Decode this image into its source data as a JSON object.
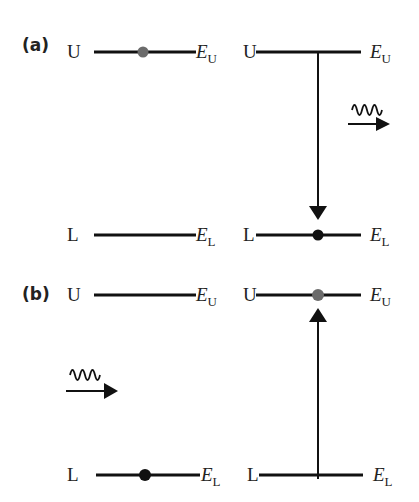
{
  "diagram": {
    "panels": [
      {
        "label": "(a)",
        "process": "emission",
        "left": {
          "upper": {
            "letter": "U",
            "energy_symbol": "E",
            "energy_sub": "U",
            "occupied": true,
            "dot_color": "#6b6b6b"
          },
          "lower": {
            "letter": "L",
            "energy_symbol": "E",
            "energy_sub": "L",
            "occupied": false
          }
        },
        "right": {
          "upper": {
            "letter": "U",
            "energy_symbol": "E",
            "energy_sub": "U",
            "occupied": false
          },
          "lower": {
            "letter": "L",
            "energy_symbol": "E",
            "energy_sub": "L",
            "occupied": true,
            "dot_color": "#111111"
          },
          "transition": "downward arrow U to L"
        },
        "photon": "outgoing photon (wavy line + arrow) on right"
      },
      {
        "label": "(b)",
        "process": "absorption",
        "left": {
          "upper": {
            "letter": "U",
            "energy_symbol": "E",
            "energy_sub": "U",
            "occupied": false
          },
          "lower": {
            "letter": "L",
            "energy_symbol": "E",
            "energy_sub": "L",
            "occupied": true,
            "dot_color": "#111111"
          }
        },
        "right": {
          "upper": {
            "letter": "U",
            "energy_symbol": "E",
            "energy_sub": "U",
            "occupied": true,
            "dot_color": "#6b6b6b"
          },
          "lower": {
            "letter": "L",
            "energy_symbol": "E",
            "energy_sub": "L",
            "occupied": false
          },
          "transition": "upward arrow L to U"
        },
        "photon": "incoming photon (wavy line + arrow) on left"
      }
    ],
    "colors": {
      "line": "#111111",
      "excited_dot": "#6b6b6b",
      "ground_dot": "#111111",
      "text": "#222222"
    }
  }
}
